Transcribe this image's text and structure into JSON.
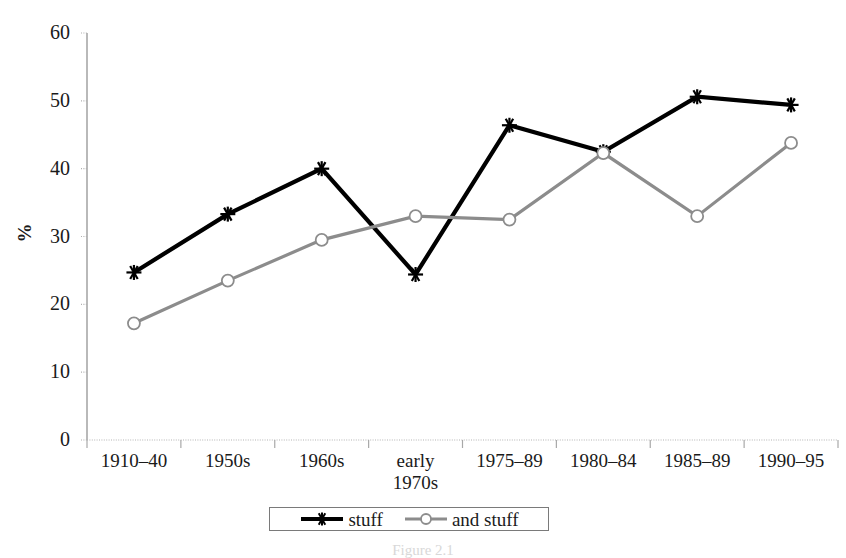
{
  "chart_data": {
    "type": "line",
    "title": "",
    "xlabel": "",
    "ylabel": "%",
    "ylim": [
      0,
      60
    ],
    "yticks": [
      0,
      10,
      20,
      30,
      40,
      50,
      60
    ],
    "grid": false,
    "legend_position": "bottom",
    "categories": [
      "1910–40",
      "1950s",
      "1960s",
      "early\n1970s",
      "1975–89",
      "1980–84",
      "1985–89",
      "1990–95"
    ],
    "series": [
      {
        "name": "stuff",
        "color": "#000000",
        "marker": "asterisk",
        "values": [
          24.7,
          33.3,
          40.0,
          24.4,
          46.4,
          42.5,
          50.6,
          49.4
        ]
      },
      {
        "name": "and stuff",
        "color": "#8c8c8c",
        "marker": "circle",
        "values": [
          17.2,
          23.5,
          29.5,
          33.0,
          32.5,
          42.3,
          33.0,
          43.8
        ]
      }
    ]
  },
  "axis": {
    "y_title": "%",
    "y_tick_labels": [
      "60",
      "50",
      "40",
      "30",
      "20",
      "10",
      "0"
    ],
    "x_tick_labels": [
      "1910–40",
      "1950s",
      "1960s",
      "early\n1970s",
      "1975–89",
      "1980–84",
      "1985–89",
      "1990–95"
    ]
  },
  "legend": {
    "entries": [
      {
        "label": "stuff",
        "color": "#000000",
        "marker": "asterisk"
      },
      {
        "label": "and stuff",
        "color": "#8c8c8c",
        "marker": "circle"
      }
    ]
  },
  "caption": {
    "text": "Figure 2.1"
  }
}
